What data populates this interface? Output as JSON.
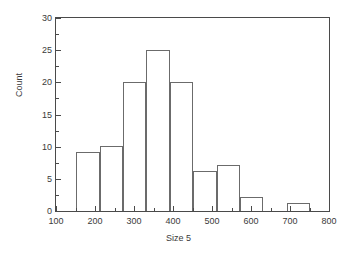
{
  "chart_data": {
    "type": "bar",
    "title": "",
    "subtitle": "",
    "xlabel": "Size 5",
    "ylabel": "Count",
    "xlim": [
      100,
      800
    ],
    "ylim": [
      0,
      30
    ],
    "grid": false,
    "legend": null,
    "x_ticks": [
      100,
      200,
      300,
      400,
      500,
      600,
      700,
      800
    ],
    "x_tick_labels": [
      "100",
      "200",
      "300",
      "400",
      "500",
      "600",
      "700",
      "800"
    ],
    "x_minor_ticks": [
      150,
      250,
      350,
      450,
      550,
      650,
      750
    ],
    "y_ticks": [
      0,
      5,
      10,
      15,
      20,
      25,
      30
    ],
    "y_tick_labels": [
      "0",
      "5",
      "10",
      "15",
      "20",
      "25",
      "30"
    ],
    "y_minor_ticks": [
      2.5,
      7.5,
      12.5,
      17.5,
      22.5,
      27.5
    ],
    "bin_width": 60,
    "bars": [
      {
        "bin_start": 152,
        "bin_end": 212,
        "value": 9.1,
        "label": "9"
      },
      {
        "bin_start": 212,
        "bin_end": 272,
        "value": 10.1,
        "label": "10"
      },
      {
        "bin_start": 272,
        "bin_end": 332,
        "value": 20,
        "label": "20"
      },
      {
        "bin_start": 332,
        "bin_end": 392,
        "value": 25,
        "label": "25"
      },
      {
        "bin_start": 392,
        "bin_end": 452,
        "value": 20,
        "label": "20"
      },
      {
        "bin_start": 452,
        "bin_end": 512,
        "value": 6.2,
        "label": "6"
      },
      {
        "bin_start": 512,
        "bin_end": 572,
        "value": 7.2,
        "label": "7"
      },
      {
        "bin_start": 572,
        "bin_end": 632,
        "value": 2.2,
        "label": "2"
      },
      {
        "bin_start": 692,
        "bin_end": 752,
        "value": 1.2,
        "label": "1"
      }
    ],
    "colors": {
      "axis": "#4a4a4a",
      "bar_edge": "#6b6b6b",
      "bar_fill": "none",
      "background": "#ffffff",
      "text": "#3a3a3a"
    }
  }
}
